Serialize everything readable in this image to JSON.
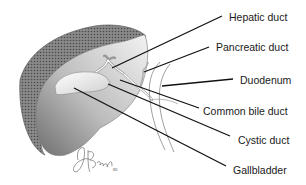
{
  "diagram": {
    "type": "anatomical-illustration",
    "labels": [
      {
        "id": "hepatic-duct",
        "text": "Hepatic duct",
        "x": 229,
        "y": 11
      },
      {
        "id": "pancreatic-duct",
        "text": "Pancreatic duct",
        "x": 216,
        "y": 41
      },
      {
        "id": "duodenum",
        "text": "Duodenum",
        "x": 240,
        "y": 74
      },
      {
        "id": "common-bile-duct",
        "text": "Common bile duct",
        "x": 203,
        "y": 105
      },
      {
        "id": "cystic-duct",
        "text": "Cystic duct",
        "x": 238,
        "y": 134
      },
      {
        "id": "gallbladder",
        "text": "Gallbladder",
        "x": 233,
        "y": 164
      }
    ],
    "signature": "ABrady MD",
    "colors": {
      "leader_line": "#111111",
      "liver_dark": "#555555",
      "liver_light": "#e6e6e6",
      "outline": "#666666"
    }
  }
}
